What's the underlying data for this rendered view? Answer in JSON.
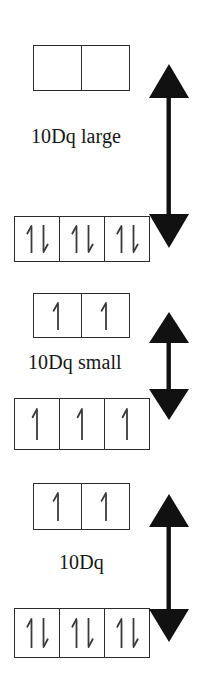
{
  "figure": {
    "background_color": "#ffffff",
    "line_color": "#2b2b2b",
    "text_color": "#161616"
  },
  "diagrams": [
    {
      "id": "strong-field-low-spin",
      "label": "10Dq large",
      "upper_level": {
        "name": "eg",
        "cells": [
          {
            "electrons": []
          },
          {
            "electrons": []
          }
        ]
      },
      "lower_level": {
        "name": "t2g",
        "cells": [
          {
            "electrons": [
              "up",
              "down"
            ]
          },
          {
            "electrons": [
              "up",
              "down"
            ]
          },
          {
            "electrons": [
              "up",
              "down"
            ]
          }
        ]
      },
      "arrow": {
        "type": "double-headed-vertical",
        "size": "large"
      }
    },
    {
      "id": "weak-field-high-spin",
      "label": "10Dq small",
      "upper_level": {
        "name": "eg",
        "cells": [
          {
            "electrons": [
              "up"
            ]
          },
          {
            "electrons": [
              "up"
            ]
          }
        ]
      },
      "lower_level": {
        "name": "t2g",
        "cells": [
          {
            "electrons": [
              "up"
            ]
          },
          {
            "electrons": [
              "up"
            ]
          },
          {
            "electrons": [
              "up"
            ]
          }
        ]
      },
      "arrow": {
        "type": "double-headed-vertical",
        "size": "small"
      }
    },
    {
      "id": "intermediate-field",
      "label": "10Dq",
      "upper_level": {
        "name": "eg",
        "cells": [
          {
            "electrons": [
              "up"
            ]
          },
          {
            "electrons": [
              "up"
            ]
          }
        ]
      },
      "lower_level": {
        "name": "t2g",
        "cells": [
          {
            "electrons": [
              "up",
              "down"
            ]
          },
          {
            "electrons": [
              "up",
              "down"
            ]
          },
          {
            "electrons": [
              "up",
              "down"
            ]
          }
        ]
      },
      "arrow": {
        "type": "double-headed-vertical",
        "size": "medium"
      }
    }
  ]
}
